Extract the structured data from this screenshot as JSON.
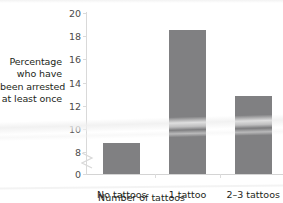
{
  "chart_data": {
    "type": "bar",
    "title": "",
    "subtitle": "",
    "categories": [
      "No tattoos",
      "1 tattoo",
      "2–3 tattoos"
    ],
    "values": [
      8.8,
      18.5,
      12.8
    ],
    "series": [
      {
        "name": "Percentage who have been arrested at least once",
        "values": [
          8.8,
          18.5,
          12.8
        ]
      }
    ],
    "xlabel": "Number of tattoos",
    "ylabel": "Percentage who have been arrested at least once",
    "ylabel_lines": [
      "Percentage",
      "who have",
      "been arrested",
      "at least once"
    ],
    "ylim": [
      8,
      20
    ],
    "y_axis_broken": true,
    "y_axis_break_between": [
      0,
      8
    ],
    "yticks": [
      {
        "value": 20,
        "label": "20"
      },
      {
        "value": 18,
        "label": "18"
      },
      {
        "value": 16,
        "label": "16"
      },
      {
        "value": 14,
        "label": "14"
      },
      {
        "value": 12,
        "label": "12"
      },
      {
        "value": 10,
        "label": "10"
      },
      {
        "value": 8,
        "label": "8"
      },
      {
        "value": 0,
        "label": "0"
      }
    ],
    "grid": false,
    "legend": false,
    "legend_position": "none",
    "bar_color": "#808082",
    "axis_color": "#d9d9d9",
    "text_color": "#231f20",
    "annotations": []
  }
}
